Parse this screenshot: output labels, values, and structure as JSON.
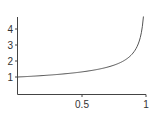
{
  "chart_data": {
    "type": "line",
    "title": "",
    "xlabel": "",
    "ylabel": "",
    "xlim": [
      0,
      1
    ],
    "ylim": [
      0,
      4.8
    ],
    "grid": false,
    "legend": null,
    "x_ticks": [
      0.5,
      1
    ],
    "x_tick_labels": [
      "0.5",
      "1"
    ],
    "y_ticks": [
      1,
      2,
      3,
      4
    ],
    "y_tick_labels": [
      "1",
      "2",
      "3",
      "4"
    ],
    "series": [
      {
        "name": "curve",
        "color": "#555555",
        "x": [
          0,
          0.1,
          0.2,
          0.3,
          0.4,
          0.5,
          0.6,
          0.7,
          0.8,
          0.85,
          0.9,
          0.93,
          0.95,
          0.97,
          0.98
        ],
        "y": [
          1.0,
          1.04,
          1.09,
          1.15,
          1.23,
          1.32,
          1.44,
          1.62,
          1.9,
          2.14,
          2.51,
          2.87,
          3.31,
          4.07,
          4.78
        ]
      }
    ]
  },
  "colors": {
    "axis": "#444444",
    "line": "#555555"
  }
}
